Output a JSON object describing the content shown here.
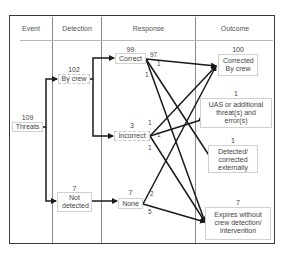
{
  "headers": {
    "event": "Event",
    "detection": "Detection",
    "response": "Response",
    "outcome": "Outcome"
  },
  "nodes": {
    "threats": {
      "count": "109",
      "label": "Threats"
    },
    "by_crew": {
      "count": "102",
      "label": "By crew"
    },
    "not_detected": {
      "count": "7",
      "label": "Not detected"
    },
    "correct": {
      "count": "99",
      "label": "Correct"
    },
    "incorrect": {
      "count": "3",
      "label": "Incorrect"
    },
    "none": {
      "count": "7",
      "label": "None"
    },
    "corrected_by_crew": {
      "count": "100",
      "label": "Corrected By crew"
    },
    "uas_or_additional": {
      "count": "1",
      "label": "UAS or additional threat(s) and error(s)"
    },
    "detected_externally": {
      "count": "1",
      "label": "Detected/ corrected externally"
    },
    "expires": {
      "count": "7",
      "label": "Expires without crew detection/ intervention"
    }
  },
  "edge_labels": {
    "correct_to_corrected": "97",
    "correct_to_detected": "1",
    "correct_to_expires": "1",
    "incorrect_to_corrected": "1",
    "incorrect_to_uas": "1",
    "incorrect_to_expires": "1",
    "none_to_corrected": "2",
    "none_to_expires": "5"
  },
  "colors": {
    "line": "#1a1a1a",
    "frame": "#3a3a3a",
    "divider": "#8a8a8a"
  }
}
